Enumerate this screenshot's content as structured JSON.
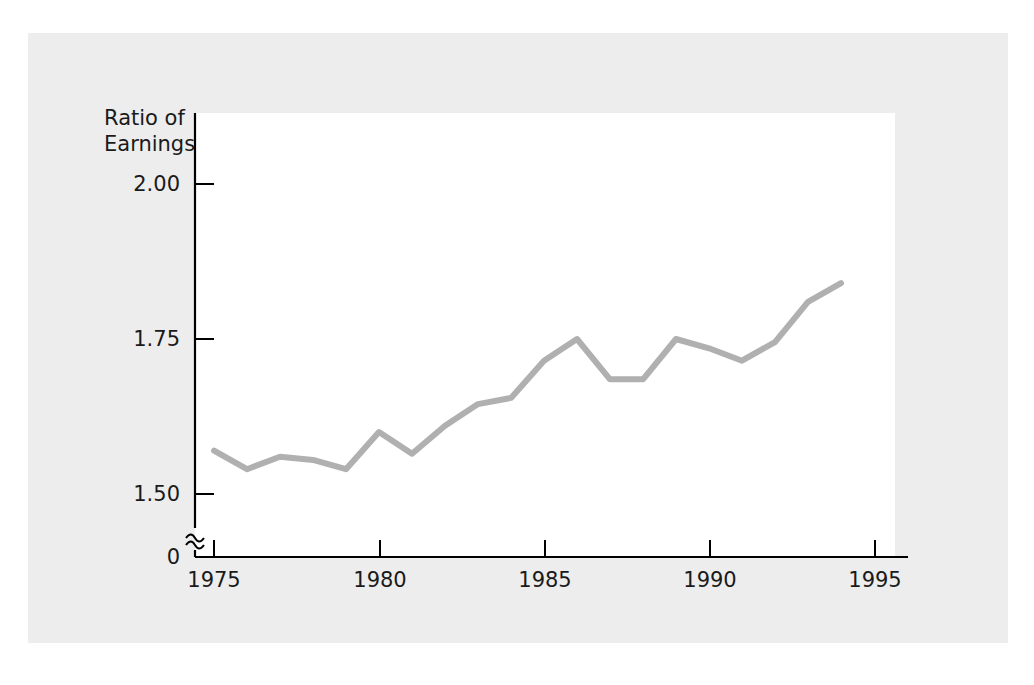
{
  "chart_data": {
    "type": "line",
    "title": "",
    "subtitle": "",
    "ylabel": "Ratio of Earnings",
    "ylabel_line1": "Ratio of",
    "ylabel_line2": "Earnings",
    "xlabel": "",
    "x": [
      1975,
      1976,
      1977,
      1978,
      1979,
      1980,
      1981,
      1982,
      1983,
      1984,
      1985,
      1986,
      1987,
      1988,
      1989,
      1990,
      1991,
      1992,
      1993,
      1994
    ],
    "values": [
      1.57,
      1.54,
      1.56,
      1.555,
      1.54,
      1.6,
      1.565,
      1.61,
      1.645,
      1.655,
      1.715,
      1.75,
      1.685,
      1.685,
      1.75,
      1.735,
      1.715,
      1.745,
      1.81,
      1.84
    ],
    "series": [
      {
        "name": "Ratio of Earnings",
        "color": "#b0b0b0",
        "values": [
          1.57,
          1.54,
          1.56,
          1.555,
          1.54,
          1.6,
          1.565,
          1.61,
          1.645,
          1.655,
          1.715,
          1.75,
          1.685,
          1.685,
          1.75,
          1.735,
          1.715,
          1.745,
          1.81,
          1.84
        ]
      }
    ],
    "ytick_labels": [
      "2.00",
      "1.75",
      "1.50",
      "0"
    ],
    "ytick_values": [
      2.0,
      1.75,
      1.5,
      0
    ],
    "xtick_labels": [
      "1975",
      "1980",
      "1985",
      "1990",
      "1995"
    ],
    "xtick_values": [
      1975,
      1980,
      1985,
      1990,
      1995
    ],
    "ylim": [
      1.45,
      2.06
    ],
    "xlim": [
      1974,
      1995.6
    ],
    "y_axis_break": true,
    "y_axis_break_symbol": "squiggle",
    "grid": false,
    "legend": false,
    "legend_position": "none",
    "annotations": []
  },
  "style": {
    "figure_background": "#ededed",
    "plot_background": "#ffffff",
    "axis_color": "#000000",
    "line_color": "#b0b0b0",
    "text_color": "#1a1a1a"
  }
}
